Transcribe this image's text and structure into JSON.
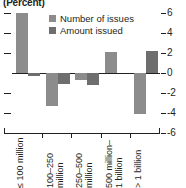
{
  "chart_data": {
    "type": "bar",
    "title": "(Percent)",
    "xlabel": "",
    "ylabel": "",
    "ylim": [
      -6,
      6
    ],
    "yticks": [
      6,
      4,
      2,
      0,
      -2,
      -4,
      -6
    ],
    "ytick_labels": [
      "6",
      "4",
      "2",
      "0",
      "-2",
      "-4",
      "-6"
    ],
    "grid": false,
    "legend_position": "top-center",
    "categories": [
      "≤ 100 million",
      "100–250 million",
      "250–500 million",
      "500 million– 1 billion",
      "> 1 billion"
    ],
    "category_lines": [
      [
        "≤ 100 million",
        ""
      ],
      [
        "100–250",
        "million"
      ],
      [
        "250–500",
        "million"
      ],
      [
        "500 million–",
        "1 billion"
      ],
      [
        "> 1 billion",
        ""
      ]
    ],
    "series": [
      {
        "name": "Number of issues",
        "color": "#8c8c8c",
        "values": [
          6.0,
          -3.3,
          -0.7,
          2.1,
          -4.1
        ]
      },
      {
        "name": "Amount issued",
        "color": "#6e6e6e",
        "values": [
          -0.25,
          -1.1,
          -1.2,
          0.0,
          2.2
        ]
      }
    ]
  },
  "colors": {
    "axis": "#231f20",
    "series_0": "#8c8c8c",
    "series_1": "#6e6e6e",
    "background": "#ffffff"
  }
}
